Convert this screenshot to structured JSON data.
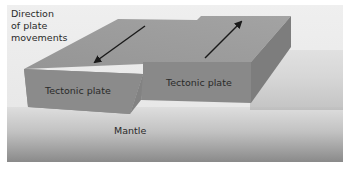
{
  "diagram": {
    "caption_label": [
      "Direction",
      "of plate",
      "movements"
    ],
    "left_plate_label": "Tectonic plate",
    "right_plate_label": "Tectonic plate",
    "mantle_label": "Mantle",
    "arrows": [
      {
        "name": "left-plate-arrow",
        "direction": "toward viewer (down-left)"
      },
      {
        "name": "right-plate-arrow",
        "direction": "away from viewer (up-right)"
      }
    ],
    "colors": {
      "background_top": "#ececec",
      "mantle_top": "#dcdcdc",
      "mantle_bottom": "#8c8c8c",
      "plate_top": "#9a9a9a",
      "plate_front": "#8a8a8a",
      "plate_side": "#7e7e7e",
      "arrow": "#1a1a1a"
    }
  }
}
